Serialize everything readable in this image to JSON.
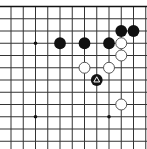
{
  "board": {
    "grid": {
      "origin_x": 11,
      "origin_y": 6.5,
      "spacing": 12.25,
      "cols": 12,
      "rows": 12,
      "top_edge": true,
      "left_edge": false,
      "right_edge": false,
      "bottom_edge": false,
      "line_color": "#333333",
      "edge_color": "#111111",
      "background": "#ffffff"
    },
    "star_points": [
      {
        "col": 2,
        "row": 3
      },
      {
        "col": 2,
        "row": 9
      },
      {
        "col": 8,
        "row": 9
      }
    ],
    "stones": [
      {
        "color": "black",
        "col": 9,
        "row": 2
      },
      {
        "color": "black",
        "col": 10,
        "row": 2
      },
      {
        "color": "black",
        "col": 4,
        "row": 3
      },
      {
        "color": "black",
        "col": 6,
        "row": 3
      },
      {
        "color": "black",
        "col": 8,
        "row": 3
      },
      {
        "color": "white",
        "col": 9,
        "row": 3
      },
      {
        "color": "white",
        "col": 9,
        "row": 4
      },
      {
        "color": "white",
        "col": 6,
        "row": 5
      },
      {
        "color": "white",
        "col": 8,
        "row": 5
      },
      {
        "color": "black",
        "col": 7,
        "row": 6,
        "marker": "triangle"
      },
      {
        "color": "white",
        "col": 9,
        "row": 8
      }
    ],
    "colors": {
      "black_stone": "#111111",
      "white_stone": "#ffffff",
      "white_stone_border": "#444444",
      "marker": "#ffffff"
    }
  }
}
